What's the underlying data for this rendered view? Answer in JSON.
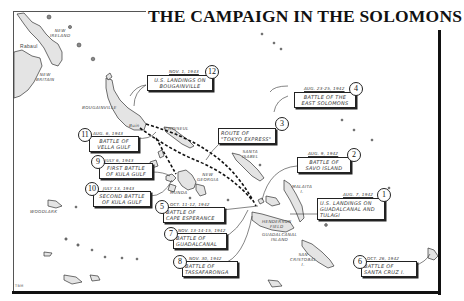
{
  "title": "THE CAMPAIGN IN THE SOLOMONS",
  "credit": "TBM",
  "place_labels": {
    "rabaul": "Rabaul",
    "new_ireland": "NEW\nIRELAND",
    "new_britain": "NEW\nBRITAIN",
    "bougainville": "BOUGAINVILLE",
    "buin": "Buin",
    "choiseul": "CHOISEUL\nI.",
    "santa_isabel": "SANTA\nISABEL",
    "new_georgia": "NEW\nGEORGIA",
    "munda": "MUNDA",
    "malaita": "MALAITA\nI.",
    "henderson_field": "HENDERSON\nFIELD",
    "guadalcanal_island": "GUADALCANAL\nISLAND",
    "san_cristobal": "SAN\nCRISTOBAL\nI.",
    "woodlark": "WOODLARK"
  },
  "events": [
    {
      "num": "1",
      "date": "AUG. 7, 1942",
      "label": "U.S. LANDINGS ON\nGUADALCANAL AND\nTULAGI"
    },
    {
      "num": "2",
      "date": "AUG. 9, 1942",
      "label": "BATTLE OF\nSAVO ISLAND"
    },
    {
      "num": "3",
      "date": "",
      "label": "ROUTE OF\n\"TOKYO EXPRESS\""
    },
    {
      "num": "4",
      "date": "AUG. 23-25, 1942",
      "label": "BATTLE OF THE\nEAST SOLOMONS"
    },
    {
      "num": "5",
      "date": "OCT. 11-12, 1942",
      "label": "BATTLE OF\nCAPE ESPERANCE"
    },
    {
      "num": "6",
      "date": "OCT. 26, 1942",
      "label": "BATTLE OF\nSANTA CRUZ I."
    },
    {
      "num": "7",
      "date": "NOV. 13-14-15, 1942",
      "label": "BATTLE OF\nGUADALCANAL"
    },
    {
      "num": "8",
      "date": "NOV. 30, 1942",
      "label": "BATTLE OF\nTASSAFARONGA"
    },
    {
      "num": "9",
      "date": "JULY 6, 1943",
      "label": "FIRST BATTLE\nOF KULA GULF"
    },
    {
      "num": "10",
      "date": "JULY 13, 1943",
      "label": "SECOND BATTLE\nOF KULA GULF"
    },
    {
      "num": "11",
      "date": "AUG. 6, 1943",
      "label": "BATTLE OF\nVELLA GULF"
    },
    {
      "num": "12",
      "date": "NOV. 1, 1943",
      "label": "U.S. LANDINGS ON\nBOUGAINVILLE"
    }
  ]
}
